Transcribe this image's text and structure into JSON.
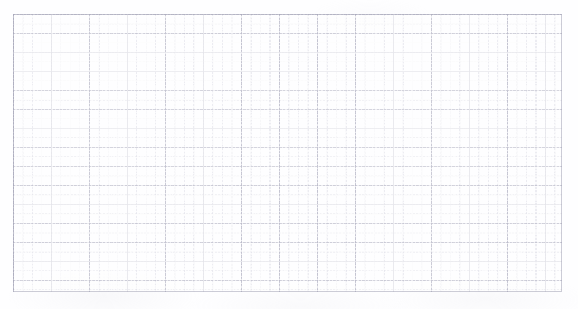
{
  "document": {
    "kind": "graph-paper-sheet",
    "title": "",
    "text_content": "",
    "annotations": []
  },
  "canvas": {
    "width_px": 578,
    "height_px": 309,
    "background_color": "#ffffff",
    "paper_tone_color": "#fefeff"
  },
  "grid": {
    "origin_x_px": 13,
    "origin_y_px": 14,
    "width_px": 549,
    "height_px": 278,
    "minor_cell_width_px": 9.5,
    "minor_cell_height_px": 9.5,
    "major_column_spacing_px": 38,
    "major_row_spacing_px": 19,
    "minor_columns": 58,
    "minor_rows": 29,
    "major_columns": 14,
    "major_rows": 14,
    "minor_line_color": "#b2b2c6",
    "major_line_color": "#9696ac",
    "frame_line_color": "#9696ac",
    "line_style": "dotted-dashed",
    "has_labels": false,
    "has_axis_ticks": false
  },
  "marks": {
    "count": 0,
    "description": ""
  }
}
